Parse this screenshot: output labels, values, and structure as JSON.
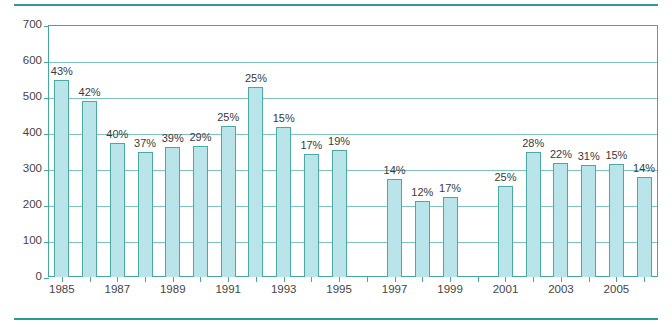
{
  "chart_data": {
    "type": "bar",
    "title": "",
    "subtitle": "",
    "xlabel": "",
    "ylabel": "",
    "ylim": [
      0,
      700
    ],
    "ytick_step": 100,
    "yticks": [
      "0",
      "100",
      "200",
      "300",
      "400",
      "500",
      "600",
      "700"
    ],
    "grid": true,
    "legend": null,
    "xticks_shown": [
      "1985",
      "1987",
      "1989",
      "1991",
      "1993",
      "1995",
      "1997",
      "1999",
      "2001",
      "2003",
      "2005"
    ],
    "categories": [
      "1985",
      "1986",
      "1987",
      "1988",
      "1989",
      "1990",
      "1991",
      "1992",
      "1993",
      "1994",
      "1995",
      "1996",
      "1997",
      "1998",
      "1999",
      "2000",
      "2001",
      "2002",
      "2003",
      "2004",
      "2005",
      "2006"
    ],
    "values": [
      548,
      490,
      372,
      348,
      362,
      365,
      420,
      528,
      418,
      342,
      352,
      null,
      272,
      212,
      222,
      null,
      252,
      348,
      318,
      312,
      315,
      278
    ],
    "data_labels": [
      "43%",
      "42%",
      "40%",
      "37%",
      "39%",
      "29%",
      "25%",
      "25%",
      "15%",
      "17%",
      "19%",
      "",
      "14%",
      "12%",
      "17%",
      "",
      "25%",
      "28%",
      "22%",
      "31%",
      "15%",
      "14%"
    ],
    "colors": {
      "bar_fill": "#b9e5ea",
      "bar_border": "#4aa9a3",
      "gridline": "#7cc4c0",
      "axis": "#45a8a0",
      "rule": "#2e9b93",
      "text": "#444444",
      "background": "#ffffff"
    }
  }
}
